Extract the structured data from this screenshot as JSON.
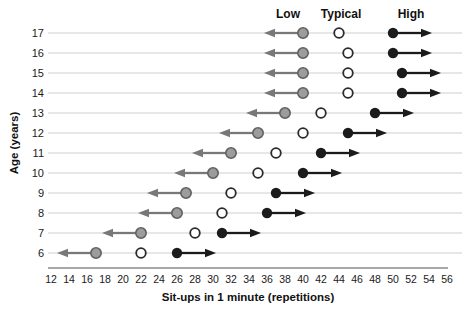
{
  "chart_data": {
    "type": "scatter",
    "title": "",
    "xlabel": "Sit-ups in 1 minute (repetitions)",
    "ylabel": "Age (years)",
    "xlim": [
      12,
      56
    ],
    "x_ticks": [
      12,
      14,
      16,
      18,
      20,
      22,
      24,
      26,
      28,
      30,
      32,
      34,
      36,
      38,
      40,
      42,
      44,
      46,
      48,
      50,
      52,
      54,
      56
    ],
    "grid": "horizontal",
    "legend": {
      "low": "Low",
      "typical": "Typical",
      "high": "High"
    },
    "legend_position": "top",
    "series_notes": {
      "low": "gray dot with arrow extending left (lower values)",
      "typical": "open white circle",
      "high": "black dot with arrow extending right (higher values)"
    },
    "rows": [
      {
        "age": 6,
        "low": 17,
        "typical": 22,
        "high": 26
      },
      {
        "age": 7,
        "low": 22,
        "typical": 28,
        "high": 31
      },
      {
        "age": 8,
        "low": 26,
        "typical": 31,
        "high": 36
      },
      {
        "age": 9,
        "low": 27,
        "typical": 32,
        "high": 37
      },
      {
        "age": 10,
        "low": 30,
        "typical": 35,
        "high": 40
      },
      {
        "age": 11,
        "low": 32,
        "typical": 37,
        "high": 42
      },
      {
        "age": 12,
        "low": 35,
        "typical": 40,
        "high": 45
      },
      {
        "age": 13,
        "low": 38,
        "typical": 42,
        "high": 48
      },
      {
        "age": 14,
        "low": 40,
        "typical": 45,
        "high": 51
      },
      {
        "age": 15,
        "low": 40,
        "typical": 45,
        "high": 51
      },
      {
        "age": 16,
        "low": 40,
        "typical": 45,
        "high": 50
      },
      {
        "age": 17,
        "low": 40,
        "typical": 44,
        "high": 50
      }
    ],
    "colors": {
      "low_dot_fill": "#9c9c9c",
      "low_dot_stroke": "#616161",
      "low_arrow": "#787878",
      "typical_fill": "#ffffff",
      "typical_stroke": "#2a2a2a",
      "high_color": "#1b1b1b",
      "gridline": "#cfcfcf",
      "axis_line": "#8a8a8a",
      "text": "#1a1a1a"
    }
  }
}
